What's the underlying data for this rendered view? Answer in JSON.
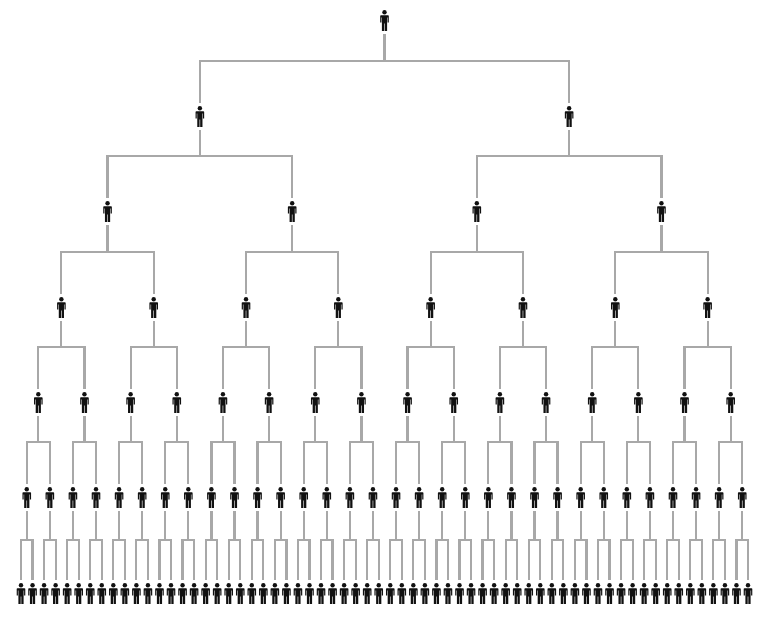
{
  "diagram": {
    "type": "binary-tree",
    "title": "",
    "levels": 7,
    "nodes_per_level": [
      1,
      2,
      4,
      8,
      16,
      32,
      64
    ],
    "total_nodes": 127,
    "node_icon": "person-icon",
    "colors": {
      "icon": "#111111",
      "connector": "#a8a8a8",
      "background": "#ffffff"
    },
    "layout": {
      "leaf_x_start": 21,
      "leaf_x_end": 748,
      "level_icon_top": [
        10,
        106,
        201,
        297,
        392,
        487,
        583
      ],
      "level_bar_y": [
        61,
        156,
        252,
        347,
        442,
        540
      ],
      "icon_height": 21,
      "icon_width": 8
    }
  }
}
